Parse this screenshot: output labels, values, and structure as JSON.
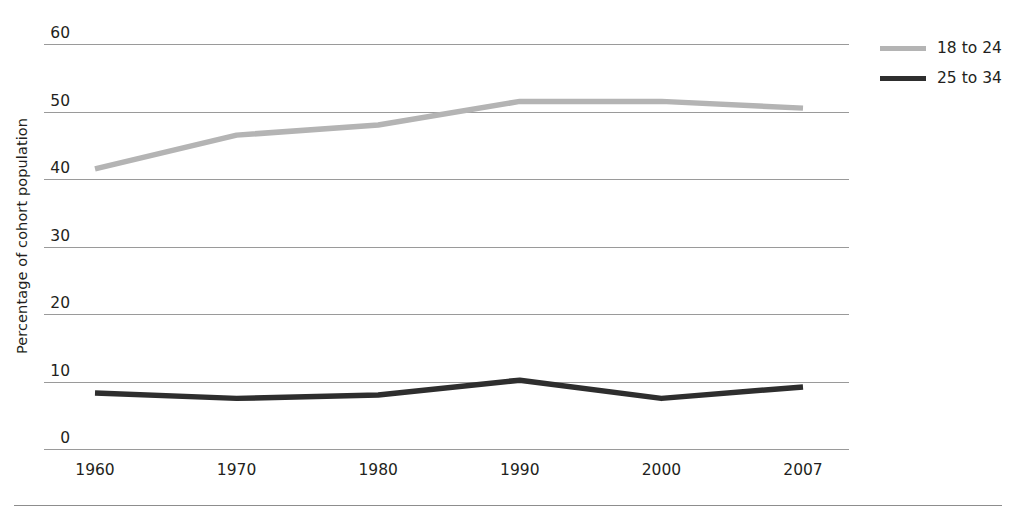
{
  "chart_data": {
    "type": "line",
    "title": "",
    "xlabel": "",
    "ylabel": "Percentage of cohort population",
    "x": [
      "1960",
      "1970",
      "1980",
      "1990",
      "2000",
      "2007"
    ],
    "categories": [
      "1960",
      "1970",
      "1980",
      "1990",
      "2000",
      "2007"
    ],
    "ylim": [
      0,
      60
    ],
    "yticks": [
      0,
      10,
      20,
      30,
      40,
      50,
      60
    ],
    "ytick_labels": [
      "0",
      "10",
      "20",
      "30",
      "40",
      "50",
      "60"
    ],
    "grid": true,
    "legend_position": "right",
    "series": [
      {
        "name": "18 to 24",
        "color": "#b4b4b4",
        "values": [
          41.5,
          46.5,
          48.0,
          51.5,
          51.5,
          50.5
        ]
      },
      {
        "name": "25 to 34",
        "color": "#2e2e2e",
        "values": [
          8.3,
          7.5,
          8.0,
          10.2,
          7.5,
          9.2
        ]
      }
    ]
  },
  "legend": {
    "items": [
      {
        "label": "18 to 24",
        "swatch": "light"
      },
      {
        "label": "25 to 34",
        "swatch": "dark"
      }
    ]
  },
  "colors": {
    "series_light": "#b4b4b4",
    "series_dark": "#2e2e2e",
    "gridline": "#9a9a9a",
    "text": "#231f20",
    "rule": "#8d8d8d"
  }
}
